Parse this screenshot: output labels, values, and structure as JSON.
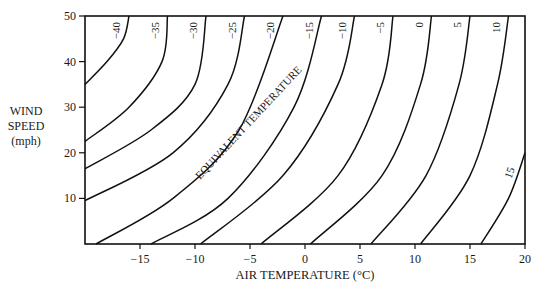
{
  "chart_data": {
    "type": "line",
    "title": "",
    "xlabel": "AIR TEMPERATURE (°C)",
    "ylabel": "WIND SPEED (mph)",
    "ylabel_lines": [
      "WIND",
      "SPEED",
      "(mph)"
    ],
    "xlim": [
      -20,
      20
    ],
    "ylim": [
      0,
      50
    ],
    "x_ticks": [
      -15,
      -10,
      -5,
      0,
      5,
      10,
      15,
      20
    ],
    "x_tick_labels": [
      "−15",
      "−10",
      "−5",
      "0",
      "5",
      "10",
      "15",
      "20"
    ],
    "y_ticks": [
      10,
      20,
      30,
      40,
      50
    ],
    "y_tick_labels": [
      "10",
      "20",
      "30",
      "40",
      "50"
    ],
    "grid": false,
    "annotation": "EQUIVALENT TEMPERATURE",
    "series_description": "Contours of equivalent (wind chill) temperature in °C; each series gives [air temperature °C, wind speed mph] points along the isoline",
    "series": [
      {
        "name": "−40",
        "points": [
          [
            -20,
            35
          ],
          [
            -18,
            40
          ],
          [
            -16.5,
            45
          ],
          [
            -16,
            50
          ]
        ]
      },
      {
        "name": "−35",
        "points": [
          [
            -20,
            22.5
          ],
          [
            -16,
            30
          ],
          [
            -13,
            40
          ],
          [
            -12.5,
            50
          ]
        ]
      },
      {
        "name": "−30",
        "points": [
          [
            -20,
            16.5
          ],
          [
            -14,
            25
          ],
          [
            -10,
            35
          ],
          [
            -9,
            50
          ]
        ]
      },
      {
        "name": "−25",
        "points": [
          [
            -20,
            9.5
          ],
          [
            -12,
            20
          ],
          [
            -7,
            35
          ],
          [
            -5.5,
            50
          ]
        ]
      },
      {
        "name": "−20",
        "points": [
          [
            -19,
            0
          ],
          [
            -12,
            10
          ],
          [
            -6,
            25
          ],
          [
            -2,
            50
          ]
        ]
      },
      {
        "name": "−15",
        "points": [
          [
            -14,
            0
          ],
          [
            -7,
            10
          ],
          [
            -1,
            30
          ],
          [
            1.5,
            50
          ]
        ]
      },
      {
        "name": "−10",
        "points": [
          [
            -9.5,
            0
          ],
          [
            -2,
            15
          ],
          [
            3,
            35
          ],
          [
            4.5,
            50
          ]
        ]
      },
      {
        "name": "−5",
        "points": [
          [
            -4,
            0
          ],
          [
            3,
            15
          ],
          [
            7,
            35
          ],
          [
            8,
            50
          ]
        ]
      },
      {
        "name": "0",
        "points": [
          [
            0.5,
            0
          ],
          [
            7,
            15
          ],
          [
            10.5,
            35
          ],
          [
            11.5,
            50
          ]
        ]
      },
      {
        "name": "5",
        "points": [
          [
            6,
            0
          ],
          [
            11,
            15
          ],
          [
            14,
            35
          ],
          [
            15,
            50
          ]
        ]
      },
      {
        "name": "10",
        "points": [
          [
            10.5,
            0
          ],
          [
            15,
            15
          ],
          [
            17.5,
            35
          ],
          [
            18.5,
            50
          ]
        ]
      },
      {
        "name": "15",
        "points": [
          [
            16,
            0
          ],
          [
            18.5,
            10
          ],
          [
            20,
            20
          ]
        ]
      }
    ],
    "colors": {
      "line": "#111111",
      "background": "#ffffff"
    }
  }
}
